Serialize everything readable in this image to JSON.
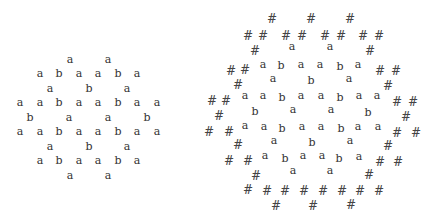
{
  "colors": {
    "glyph": "#333333",
    "hash": "#444444",
    "background": "#ffffff"
  },
  "left_pattern": {
    "glyphs": [
      {
        "c": "a",
        "x": 70,
        "y": 59
      },
      {
        "c": "a",
        "x": 108,
        "y": 59
      },
      {
        "c": "a",
        "x": 40,
        "y": 73
      },
      {
        "c": "b",
        "x": 59,
        "y": 73
      },
      {
        "c": "a",
        "x": 79,
        "y": 73
      },
      {
        "c": "a",
        "x": 98,
        "y": 73
      },
      {
        "c": "b",
        "x": 118,
        "y": 73
      },
      {
        "c": "a",
        "x": 137,
        "y": 73
      },
      {
        "c": "a",
        "x": 50,
        "y": 88
      },
      {
        "c": "b",
        "x": 89,
        "y": 88
      },
      {
        "c": "a",
        "x": 127,
        "y": 88
      },
      {
        "c": "a",
        "x": 20,
        "y": 102
      },
      {
        "c": "a",
        "x": 40,
        "y": 102
      },
      {
        "c": "b",
        "x": 59,
        "y": 102
      },
      {
        "c": "a",
        "x": 79,
        "y": 102
      },
      {
        "c": "a",
        "x": 98,
        "y": 102
      },
      {
        "c": "b",
        "x": 118,
        "y": 102
      },
      {
        "c": "a",
        "x": 137,
        "y": 102
      },
      {
        "c": "a",
        "x": 157,
        "y": 102
      },
      {
        "c": "b",
        "x": 30,
        "y": 117
      },
      {
        "c": "a",
        "x": 69,
        "y": 117
      },
      {
        "c": "a",
        "x": 108,
        "y": 117
      },
      {
        "c": "b",
        "x": 147,
        "y": 117
      },
      {
        "c": "a",
        "x": 20,
        "y": 131
      },
      {
        "c": "a",
        "x": 40,
        "y": 131
      },
      {
        "c": "b",
        "x": 59,
        "y": 131
      },
      {
        "c": "a",
        "x": 79,
        "y": 131
      },
      {
        "c": "a",
        "x": 98,
        "y": 131
      },
      {
        "c": "b",
        "x": 118,
        "y": 131
      },
      {
        "c": "a",
        "x": 137,
        "y": 131
      },
      {
        "c": "a",
        "x": 157,
        "y": 131
      },
      {
        "c": "a",
        "x": 50,
        "y": 146
      },
      {
        "c": "b",
        "x": 89,
        "y": 146
      },
      {
        "c": "a",
        "x": 127,
        "y": 146
      },
      {
        "c": "a",
        "x": 40,
        "y": 160
      },
      {
        "c": "b",
        "x": 59,
        "y": 160
      },
      {
        "c": "a",
        "x": 79,
        "y": 160
      },
      {
        "c": "a",
        "x": 98,
        "y": 160
      },
      {
        "c": "b",
        "x": 118,
        "y": 160
      },
      {
        "c": "a",
        "x": 137,
        "y": 160
      },
      {
        "c": "a",
        "x": 70,
        "y": 175
      },
      {
        "c": "a",
        "x": 108,
        "y": 175
      }
    ]
  },
  "right_pattern": {
    "glyphs": [
      {
        "c": "#",
        "x": 272,
        "y": 19
      },
      {
        "c": "#",
        "x": 311,
        "y": 19
      },
      {
        "c": "#",
        "x": 350,
        "y": 19
      },
      {
        "c": "#",
        "x": 248,
        "y": 36
      },
      {
        "c": "#",
        "x": 263,
        "y": 36
      },
      {
        "c": "#",
        "x": 286,
        "y": 36
      },
      {
        "c": "#",
        "x": 302,
        "y": 36
      },
      {
        "c": "#",
        "x": 325,
        "y": 36
      },
      {
        "c": "#",
        "x": 341,
        "y": 36
      },
      {
        "c": "#",
        "x": 363,
        "y": 36
      },
      {
        "c": "#",
        "x": 379,
        "y": 36
      },
      {
        "c": "a",
        "x": 292,
        "y": 46
      },
      {
        "c": "a",
        "x": 330,
        "y": 46
      },
      {
        "c": "#",
        "x": 255,
        "y": 51
      },
      {
        "c": "#",
        "x": 370,
        "y": 51
      },
      {
        "c": "a",
        "x": 263,
        "y": 64
      },
      {
        "c": "b",
        "x": 281,
        "y": 65
      },
      {
        "c": "a",
        "x": 301,
        "y": 64
      },
      {
        "c": "a",
        "x": 320,
        "y": 64
      },
      {
        "c": "b",
        "x": 340,
        "y": 66
      },
      {
        "c": "a",
        "x": 358,
        "y": 64
      },
      {
        "c": "#",
        "x": 231,
        "y": 71
      },
      {
        "c": "#",
        "x": 245,
        "y": 70
      },
      {
        "c": "#",
        "x": 380,
        "y": 71
      },
      {
        "c": "#",
        "x": 396,
        "y": 71
      },
      {
        "c": "a",
        "x": 273,
        "y": 78
      },
      {
        "c": "b",
        "x": 311,
        "y": 80
      },
      {
        "c": "a",
        "x": 349,
        "y": 78
      },
      {
        "c": "#",
        "x": 238,
        "y": 85
      },
      {
        "c": "#",
        "x": 388,
        "y": 86
      },
      {
        "c": "a",
        "x": 245,
        "y": 95
      },
      {
        "c": "a",
        "x": 263,
        "y": 95
      },
      {
        "c": "b",
        "x": 282,
        "y": 97
      },
      {
        "c": "a",
        "x": 301,
        "y": 95
      },
      {
        "c": "a",
        "x": 321,
        "y": 95
      },
      {
        "c": "b",
        "x": 340,
        "y": 97
      },
      {
        "c": "a",
        "x": 359,
        "y": 95
      },
      {
        "c": "a",
        "x": 377,
        "y": 95
      },
      {
        "c": "#",
        "x": 212,
        "y": 101
      },
      {
        "c": "#",
        "x": 226,
        "y": 101
      },
      {
        "c": "#",
        "x": 397,
        "y": 102
      },
      {
        "c": "#",
        "x": 413,
        "y": 102
      },
      {
        "c": "b",
        "x": 255,
        "y": 111
      },
      {
        "c": "a",
        "x": 293,
        "y": 109
      },
      {
        "c": "a",
        "x": 331,
        "y": 109
      },
      {
        "c": "b",
        "x": 368,
        "y": 112
      },
      {
        "c": "#",
        "x": 219,
        "y": 116
      },
      {
        "c": "#",
        "x": 406,
        "y": 117
      },
      {
        "c": "a",
        "x": 245,
        "y": 125
      },
      {
        "c": "a",
        "x": 264,
        "y": 126
      },
      {
        "c": "b",
        "x": 282,
        "y": 128
      },
      {
        "c": "a",
        "x": 302,
        "y": 126
      },
      {
        "c": "a",
        "x": 321,
        "y": 126
      },
      {
        "c": "b",
        "x": 341,
        "y": 128
      },
      {
        "c": "a",
        "x": 358,
        "y": 126
      },
      {
        "c": "a",
        "x": 378,
        "y": 126
      },
      {
        "c": "#",
        "x": 209,
        "y": 132
      },
      {
        "c": "#",
        "x": 229,
        "y": 132
      },
      {
        "c": "#",
        "x": 397,
        "y": 133
      },
      {
        "c": "#",
        "x": 416,
        "y": 133
      },
      {
        "c": "a",
        "x": 274,
        "y": 140
      },
      {
        "c": "b",
        "x": 312,
        "y": 142
      },
      {
        "c": "a",
        "x": 350,
        "y": 140
      },
      {
        "c": "#",
        "x": 238,
        "y": 145
      },
      {
        "c": "#",
        "x": 388,
        "y": 146
      },
      {
        "c": "a",
        "x": 265,
        "y": 155
      },
      {
        "c": "b",
        "x": 285,
        "y": 158
      },
      {
        "c": "a",
        "x": 303,
        "y": 155
      },
      {
        "c": "a",
        "x": 322,
        "y": 155
      },
      {
        "c": "b",
        "x": 339,
        "y": 158
      },
      {
        "c": "a",
        "x": 359,
        "y": 156
      },
      {
        "c": "#",
        "x": 229,
        "y": 161
      },
      {
        "c": "#",
        "x": 248,
        "y": 161
      },
      {
        "c": "#",
        "x": 380,
        "y": 162
      },
      {
        "c": "#",
        "x": 398,
        "y": 162
      },
      {
        "c": "a",
        "x": 293,
        "y": 170
      },
      {
        "c": "a",
        "x": 330,
        "y": 170
      },
      {
        "c": "#",
        "x": 256,
        "y": 176
      },
      {
        "c": "#",
        "x": 369,
        "y": 175
      },
      {
        "c": "#",
        "x": 248,
        "y": 190
      },
      {
        "c": "#",
        "x": 267,
        "y": 191
      },
      {
        "c": "#",
        "x": 285,
        "y": 191
      },
      {
        "c": "#",
        "x": 304,
        "y": 191
      },
      {
        "c": "#",
        "x": 323,
        "y": 191
      },
      {
        "c": "#",
        "x": 342,
        "y": 191
      },
      {
        "c": "#",
        "x": 360,
        "y": 191
      },
      {
        "c": "#",
        "x": 379,
        "y": 191
      },
      {
        "c": "#",
        "x": 276,
        "y": 206
      },
      {
        "c": "#",
        "x": 313,
        "y": 206
      },
      {
        "c": "#",
        "x": 351,
        "y": 205
      }
    ]
  }
}
